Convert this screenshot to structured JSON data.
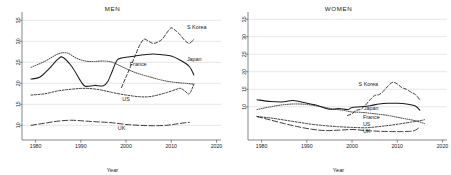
{
  "figure": {
    "panels": [
      "men",
      "women"
    ],
    "colors": {
      "line": "#1a1a1a",
      "grid": "#c8c8c8",
      "axis": "#555555",
      "background": "#ffffff"
    }
  },
  "chart_data": [
    {
      "type": "line",
      "title": "MEN",
      "xlabel": "Year",
      "ylabel": "",
      "xlim": [
        1977,
        2021
      ],
      "ylim": [
        6.5,
        36.5
      ],
      "xticks": [
        1980,
        1990,
        2000,
        2010,
        2020
      ],
      "xticklabels": [
        "1980",
        "1990",
        "2000",
        "2010",
        "2020"
      ],
      "yticks": [
        10,
        15,
        20,
        25,
        30,
        35
      ],
      "yticklabels": [
        "10",
        "15",
        "20",
        "25",
        "30",
        "35"
      ],
      "grid": true,
      "legend": "inline-labels",
      "series": [
        {
          "name": "S Korea",
          "style": "dashed",
          "label": "S Korea",
          "x": [
            1999,
            2000,
            2001,
            2002,
            2003,
            2004,
            2005,
            2006,
            2007,
            2008,
            2009,
            2010,
            2011,
            2012,
            2013,
            2014,
            2015
          ],
          "values": [
            19.0,
            21.5,
            24.0,
            26.5,
            29.0,
            30.5,
            30.0,
            29.5,
            29.8,
            30.5,
            32.0,
            33.2,
            32.5,
            31.5,
            30.2,
            29.5,
            30.5
          ]
        },
        {
          "name": "Japan",
          "style": "solid",
          "label": "Japan",
          "x": [
            1979,
            1981,
            1983,
            1985,
            1986,
            1988,
            1990,
            1991,
            1993,
            1995,
            1996,
            1997,
            1998,
            1999,
            2000,
            2002,
            2004,
            2006,
            2008,
            2010,
            2012,
            2014,
            2015
          ],
          "values": [
            21.0,
            21.5,
            23.5,
            25.8,
            26.2,
            24.0,
            20.5,
            19.3,
            19.5,
            19.4,
            20.5,
            23.0,
            25.5,
            26.0,
            26.2,
            26.5,
            26.8,
            27.0,
            26.8,
            26.5,
            25.5,
            24.0,
            22.0
          ]
        },
        {
          "name": "France",
          "style": "dotted",
          "label": "France",
          "x": [
            1979,
            1982,
            1985,
            1987,
            1989,
            1991,
            1993,
            1995,
            1997,
            1999,
            2001,
            2003,
            2005,
            2007,
            2009,
            2011,
            2013,
            2015
          ],
          "values": [
            23.8,
            25.2,
            27.0,
            27.2,
            26.0,
            25.3,
            25.2,
            25.3,
            25.0,
            24.0,
            23.0,
            22.2,
            21.6,
            21.0,
            20.5,
            20.2,
            20.0,
            19.8
          ]
        },
        {
          "name": "US",
          "style": "shortdash",
          "label": "US",
          "x": [
            1979,
            1982,
            1985,
            1988,
            1991,
            1994,
            1997,
            2000,
            2003,
            2005,
            2007,
            2009,
            2011,
            2012,
            2013,
            2014,
            2015
          ],
          "values": [
            17.2,
            17.5,
            18.2,
            18.6,
            18.8,
            18.5,
            17.8,
            17.2,
            16.8,
            16.8,
            17.2,
            17.8,
            18.5,
            18.8,
            18.2,
            17.5,
            19.8
          ]
        },
        {
          "name": "UK",
          "style": "longdash",
          "label": "UK",
          "x": [
            1979,
            1982,
            1985,
            1988,
            1991,
            1994,
            1997,
            2000,
            2003,
            2006,
            2009,
            2011,
            2013,
            2014
          ],
          "values": [
            10.0,
            10.5,
            11.0,
            11.2,
            11.0,
            10.8,
            10.6,
            10.2,
            10.0,
            9.9,
            10.0,
            10.3,
            10.6,
            10.7
          ]
        }
      ]
    },
    {
      "type": "line",
      "title": "WOMEN",
      "xlabel": "Year",
      "ylabel": "",
      "xlim": [
        1977,
        2021
      ],
      "ylim": [
        0.5,
        36.5
      ],
      "xticks": [
        1980,
        1990,
        2000,
        2010,
        2020
      ],
      "xticklabels": [
        "1980",
        "1990",
        "2000",
        "2010",
        "2020"
      ],
      "yticks": [
        10,
        15,
        20,
        25,
        30,
        35
      ],
      "yticklabels": [
        "10",
        "15",
        "20",
        "25",
        "30",
        "35"
      ],
      "grid": true,
      "legend": "inline-labels",
      "series": [
        {
          "name": "S Korea",
          "style": "dashed",
          "label": "S Korea",
          "x": [
            1999,
            2000,
            2001,
            2002,
            2003,
            2004,
            2005,
            2006,
            2007,
            2008,
            2009,
            2010,
            2011,
            2012,
            2013,
            2014,
            2015
          ],
          "values": [
            7.5,
            8.0,
            9.0,
            9.3,
            10.5,
            12.0,
            13.2,
            13.5,
            14.5,
            16.0,
            17.0,
            16.5,
            15.5,
            15.0,
            14.2,
            13.5,
            12.0
          ]
        },
        {
          "name": "Japan",
          "style": "solid",
          "label": "Japan",
          "x": [
            1979,
            1982,
            1985,
            1987,
            1990,
            1992,
            1995,
            1997,
            1999,
            2000,
            2002,
            2004,
            2006,
            2008,
            2010,
            2012,
            2014,
            2015
          ],
          "values": [
            12.0,
            11.5,
            11.4,
            11.8,
            11.0,
            10.5,
            9.3,
            9.5,
            9.2,
            9.8,
            10.0,
            10.3,
            10.8,
            11.0,
            11.0,
            10.8,
            10.2,
            9.0
          ]
        },
        {
          "name": "France",
          "style": "dotted",
          "label": "France",
          "x": [
            1979,
            1982,
            1985,
            1988,
            1991,
            1994,
            1996,
            1998,
            2000,
            2002,
            2005,
            2008,
            2010,
            2012,
            2014,
            2016
          ],
          "values": [
            9.2,
            10.0,
            10.6,
            10.8,
            10.5,
            9.8,
            9.3,
            9.0,
            8.5,
            8.4,
            8.0,
            7.5,
            7.0,
            6.5,
            6.0,
            5.2
          ]
        },
        {
          "name": "US",
          "style": "shortdash",
          "label": "US",
          "x": [
            1979,
            1982,
            1985,
            1988,
            1991,
            1994,
            1997,
            2000,
            2003,
            2005,
            2007,
            2009,
            2011,
            2013,
            2015,
            2016
          ],
          "values": [
            7.2,
            6.8,
            6.2,
            5.6,
            5.0,
            4.6,
            4.3,
            4.1,
            4.0,
            4.2,
            4.5,
            4.8,
            5.2,
            5.6,
            6.0,
            6.3
          ]
        },
        {
          "name": "UK",
          "style": "longdash",
          "label": "UK",
          "x": [
            1979,
            1982,
            1985,
            1988,
            1991,
            1994,
            1997,
            2000,
            2003,
            2006,
            2009,
            2011,
            2013,
            2014,
            2015
          ],
          "values": [
            7.2,
            6.2,
            5.2,
            4.3,
            3.6,
            3.2,
            3.3,
            3.5,
            3.2,
            3.0,
            2.9,
            2.9,
            3.0,
            3.3,
            4.2
          ]
        }
      ]
    }
  ]
}
